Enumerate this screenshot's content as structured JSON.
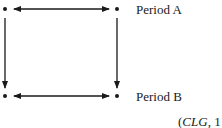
{
  "diagram": {
    "type": "relationship-square",
    "nodes": [
      {
        "id": "a1",
        "x": 5,
        "y": 9
      },
      {
        "id": "a2",
        "x": 117,
        "y": 9
      },
      {
        "id": "b1",
        "x": 5,
        "y": 96
      },
      {
        "id": "b2",
        "x": 117,
        "y": 96
      }
    ],
    "edges": [
      {
        "from": "a1",
        "to": "a2",
        "style": "double-arrow"
      },
      {
        "from": "b1",
        "to": "b2",
        "style": "double-arrow"
      },
      {
        "from": "a1",
        "to": "b1",
        "style": "arrow-down"
      },
      {
        "from": "a2",
        "to": "b2",
        "style": "arrow-down"
      }
    ],
    "labels": {
      "row_a": "Period A",
      "row_b": "Period B"
    },
    "citation": {
      "open": "(",
      "source": "CLG",
      "rest": ", 1"
    },
    "colors": {
      "ink": "#1a1a1a",
      "background": "#ffffff"
    }
  }
}
